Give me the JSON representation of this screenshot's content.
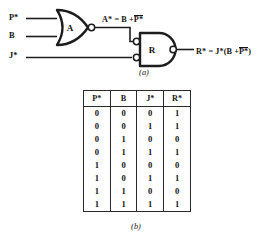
{
  "figure": {
    "part_a_caption": "(a)",
    "part_b_caption": "(b)"
  },
  "circuit": {
    "inputs": [
      {
        "name": "p-input",
        "label": "P*"
      },
      {
        "name": "b-input",
        "label": "B"
      },
      {
        "name": "j-input",
        "label": "J*"
      }
    ],
    "gates": [
      {
        "name": "gate-a",
        "label": "A",
        "type": "nor"
      },
      {
        "name": "gate-r",
        "label": "R",
        "type": "nand-with-inverted-inputs"
      }
    ],
    "equations": {
      "a_lhs": "A*",
      "a_eq": "=",
      "a_rhs_first": "B +",
      "a_rhs_bar": "P*",
      "r_lhs": "R*",
      "r_eq": "=",
      "r_rhs_open": "J*(B +",
      "r_rhs_bar": "P*",
      "r_rhs_close": ")"
    }
  },
  "truth_table": {
    "headers": [
      "P*",
      "B",
      "J*",
      "R*"
    ],
    "rows": [
      [
        "0",
        "0",
        "0",
        "1"
      ],
      [
        "0",
        "0",
        "1",
        "1"
      ],
      [
        "0",
        "1",
        "0",
        "0"
      ],
      [
        "0",
        "1",
        "1",
        "1"
      ],
      [
        "1",
        "0",
        "0",
        "0"
      ],
      [
        "1",
        "0",
        "1",
        "1"
      ],
      [
        "1",
        "1",
        "0",
        "0"
      ],
      [
        "1",
        "1",
        "1",
        "1"
      ]
    ]
  },
  "colors": {
    "ink": "#141414",
    "background": "#ffffff"
  }
}
